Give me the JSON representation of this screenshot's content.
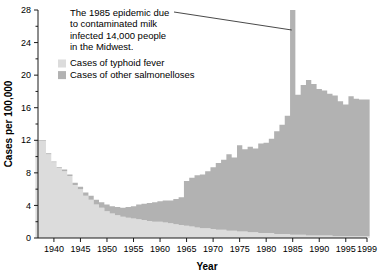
{
  "chart_data": {
    "type": "area",
    "title": "",
    "xlabel": "Year",
    "ylabel": "Cases per 100,000",
    "xlim": [
      1937,
      1999
    ],
    "ylim": [
      0,
      28
    ],
    "ytick_step": 4,
    "yminor_step": 2,
    "grid": false,
    "legend_position": "upper-left",
    "stacked": true,
    "xticks": [
      1940,
      1945,
      1950,
      1955,
      1960,
      1965,
      1970,
      1975,
      1980,
      1985,
      1990,
      1995,
      1999
    ],
    "xtick_labels": [
      "1940",
      "1945",
      "1950",
      "1955",
      "1960",
      "1965",
      "1970",
      "1975",
      "1980",
      "1985",
      "1990",
      "1995",
      "1999"
    ],
    "yticks": [
      0,
      4,
      8,
      12,
      16,
      20,
      24,
      28
    ],
    "ytick_labels": [
      "0",
      "4",
      "8",
      "12",
      "16",
      "20",
      "24",
      "28"
    ],
    "x": [
      1937,
      1938,
      1939,
      1940,
      1941,
      1942,
      1943,
      1944,
      1945,
      1946,
      1947,
      1948,
      1949,
      1950,
      1951,
      1952,
      1953,
      1954,
      1955,
      1956,
      1957,
      1958,
      1959,
      1960,
      1961,
      1962,
      1963,
      1964,
      1965,
      1966,
      1967,
      1968,
      1969,
      1970,
      1971,
      1972,
      1973,
      1974,
      1975,
      1976,
      1977,
      1978,
      1979,
      1980,
      1981,
      1982,
      1983,
      1984,
      1985,
      1986,
      1987,
      1988,
      1989,
      1990,
      1991,
      1992,
      1993,
      1994,
      1995,
      1996,
      1997,
      1998,
      1999
    ],
    "series": [
      {
        "name": "Cases of typhoid fever",
        "color": "#dcdcdc",
        "values": [
          11.9,
          11.9,
          10.3,
          9.3,
          8.6,
          8.2,
          7.6,
          6.5,
          6.0,
          5.2,
          4.7,
          4.1,
          3.7,
          3.3,
          3.0,
          2.8,
          2.6,
          2.5,
          2.4,
          2.3,
          2.2,
          2.1,
          2.0,
          2.0,
          1.9,
          1.8,
          1.7,
          1.6,
          1.5,
          1.4,
          1.3,
          1.2,
          1.2,
          1.1,
          1.0,
          1.0,
          0.9,
          0.9,
          0.8,
          0.8,
          0.7,
          0.7,
          0.6,
          0.6,
          0.6,
          0.5,
          0.5,
          0.5,
          0.4,
          0.4,
          0.4,
          0.3,
          0.3,
          0.3,
          0.3,
          0.3,
          0.2,
          0.2,
          0.2,
          0.2,
          0.2,
          0.2,
          0.2
        ]
      },
      {
        "name": "Cases of other salmonelloses",
        "color": "#b2b2b2",
        "values": [
          0.1,
          0.1,
          0.1,
          0.1,
          0.1,
          0.2,
          0.2,
          0.3,
          0.3,
          0.4,
          0.5,
          0.6,
          0.7,
          0.8,
          0.9,
          1.0,
          1.1,
          1.3,
          1.5,
          1.8,
          2.0,
          2.2,
          2.4,
          2.5,
          2.7,
          2.8,
          3.1,
          3.4,
          5.5,
          6.0,
          6.4,
          6.6,
          7.0,
          7.6,
          8.2,
          8.6,
          9.4,
          9.0,
          10.6,
          10.1,
          10.5,
          10.3,
          11.0,
          11.1,
          11.6,
          12.6,
          13.4,
          14.5,
          27.6,
          17.2,
          18.4,
          19.1,
          18.6,
          18.0,
          17.8,
          17.4,
          17.3,
          16.6,
          16.2,
          17.2,
          16.9,
          16.8,
          16.8
        ]
      }
    ],
    "annotation": {
      "lines": [
        "The 1985 epidemic due",
        "to contaminated milk",
        "infected 14,000 people",
        "in the Midwest."
      ],
      "leader_target_year": 1985
    },
    "legend": [
      {
        "label": "Cases of typhoid fever",
        "color": "#dcdcdc"
      },
      {
        "label": "Cases of other salmonelloses",
        "color": "#b2b2b2"
      }
    ]
  }
}
